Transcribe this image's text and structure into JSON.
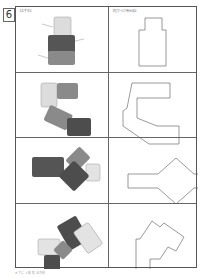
{
  "problem_number": "6",
  "headers": {
    "left": "【お手本】",
    "right": "【貼りつけ用台紙】"
  },
  "rows": [
    {
      "model": {
        "labels": [
          "黄色",
          "赤",
          "青"
        ]
      },
      "outline": "tall-bottle-shape"
    },
    {
      "model": {
        "labels": [
          "黄色",
          "赤",
          "青",
          "赤"
        ]
      },
      "outline": "c-shape-with-diagonal"
    },
    {
      "model": {
        "labels": [
          "赤",
          "青",
          "黄色",
          "赤"
        ]
      },
      "outline": "arrow-cross-shape"
    },
    {
      "model": {
        "labels": [
          "赤",
          "黄色",
          "黄色",
          "青",
          "赤"
        ]
      },
      "outline": "zigzag-t-shape"
    }
  ],
  "footer": "※ 下に 1 枚 貼 る方向"
}
